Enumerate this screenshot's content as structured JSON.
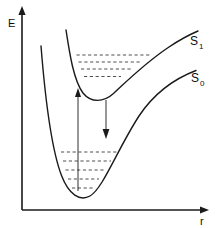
{
  "figure": {
    "title": "",
    "background_color": "#ffffff",
    "ink_color": "#1a1a1a",
    "dash_color": "#3b3b3b"
  },
  "axes": {
    "y_label": "E",
    "x_label": "r",
    "origin": [
      22,
      210
    ],
    "y_top": [
      22,
      8
    ],
    "x_right": [
      208,
      210
    ],
    "y_label_pos": [
      8,
      22
    ],
    "x_label_pos": [
      201,
      224
    ]
  },
  "states": [
    {
      "name": "S1",
      "label": "S",
      "subscript": "1",
      "label_pos": [
        190,
        45
      ],
      "sub_pos": [
        200,
        48
      ],
      "minimum": [
        100,
        99
      ],
      "dissociation_side": "right",
      "levels": 4
    },
    {
      "name": "S0",
      "label": "S",
      "subscript": "0",
      "label_pos": [
        192,
        82
      ],
      "sub_pos": [
        201,
        86
      ],
      "minimum": [
        82,
        196
      ],
      "dissociation_side": "right",
      "levels": 5
    }
  ],
  "s1_levels": [
    {
      "y": 55,
      "x1": 76.5,
      "x2": 150
    },
    {
      "y": 62,
      "x1": 78.5,
      "x2": 141
    },
    {
      "y": 69,
      "x1": 81,
      "x2": 131
    },
    {
      "y": 76.5,
      "x1": 84,
      "x2": 121
    }
  ],
  "s0_levels": [
    {
      "y": 152,
      "x1": 61,
      "x2": 117
    },
    {
      "y": 161,
      "x1": 63,
      "x2": 111
    },
    {
      "y": 170,
      "x1": 65.5,
      "x2": 105
    },
    {
      "y": 179,
      "x1": 68,
      "x2": 99
    },
    {
      "y": 188,
      "x1": 72,
      "x2": 93
    }
  ],
  "transitions": [
    {
      "name": "absorption",
      "direction": "up",
      "x": 78,
      "from_y": 190,
      "to_y": 90,
      "arrowhead_at": "top"
    },
    {
      "name": "emission",
      "direction": "down",
      "x": 106,
      "from_y": 100,
      "to_y": 138,
      "arrowhead_at": "bottom"
    }
  ],
  "curves": {
    "s1": "M 66,30 C 70,55 74,82 84,94 C 92,103 104,102 114,93 C 128,80 146,62 170,46 C 182,38 192,33 198,31",
    "s0": "M 41,46 C 45,92 52,150 62,176 C 70,196 80,201 90,196 C 104,188 118,148 140,115 C 156,92 176,78 196,70"
  },
  "annotations": {
    "description": "Morse potential energy curves for ground state S0 and excited state S1 with vibrational levels and Franck-Condon absorption/emission transitions"
  }
}
